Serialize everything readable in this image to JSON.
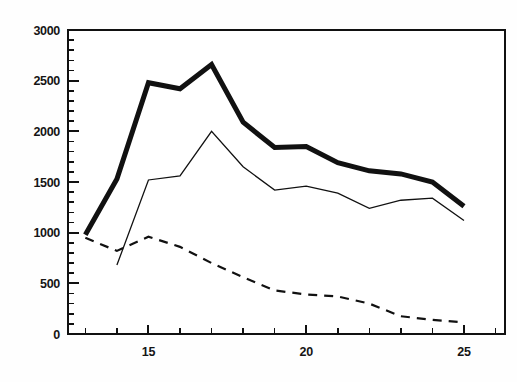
{
  "chart_data": {
    "type": "line",
    "title": "",
    "subtitle": "",
    "xlabel": "",
    "ylabel": "",
    "xlim": [
      12.45,
      26.3
    ],
    "ylim": [
      0,
      3000
    ],
    "grid": false,
    "legend": "none",
    "x_major_ticks": [
      15,
      20,
      25
    ],
    "x_major_tick_labels": [
      "15",
      "20",
      "25"
    ],
    "x_minor_tick_step": 1,
    "y_major_ticks": [
      0,
      500,
      1000,
      1500,
      2000,
      2500,
      3000
    ],
    "y_major_tick_labels": [
      "0",
      "500",
      "1000",
      "1500",
      "2000",
      "2500",
      "3000"
    ],
    "y_minor_tick_step": 100,
    "series": [
      {
        "name": "total",
        "style": "thick-solid",
        "color": "#111111",
        "width": 5.0,
        "x": [
          13,
          14,
          15,
          16,
          17,
          18,
          19,
          20,
          21,
          22,
          23,
          24,
          25
        ],
        "values": [
          980,
          1530,
          2480,
          2420,
          2660,
          2090,
          1840,
          1850,
          1690,
          1610,
          1580,
          1500,
          1260
        ]
      },
      {
        "name": "middle",
        "style": "thin-solid",
        "color": "#111111",
        "width": 1.3,
        "x": [
          14,
          15,
          16,
          17,
          18,
          19,
          20,
          21,
          22,
          23,
          24,
          25
        ],
        "values": [
          680,
          1520,
          1560,
          2000,
          1650,
          1420,
          1460,
          1390,
          1240,
          1320,
          1340,
          1120
        ]
      },
      {
        "name": "lower",
        "style": "dashed",
        "color": "#111111",
        "width": 2.2,
        "dash": "9 7",
        "x": [
          13,
          14,
          15,
          16,
          17,
          18,
          19,
          20,
          21,
          22,
          23,
          24,
          25
        ],
        "values": [
          950,
          820,
          960,
          860,
          700,
          560,
          430,
          390,
          370,
          300,
          175,
          140,
          115
        ]
      }
    ]
  },
  "axes": {
    "frame_color": "#111111",
    "frame_width": 2.4,
    "tick_color": "#111111"
  }
}
